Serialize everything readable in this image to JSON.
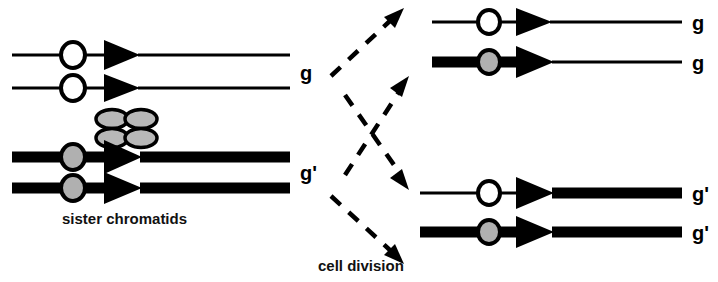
{
  "figure": {
    "background_color": "#ffffff",
    "ink_color": "#000000",
    "gray_fill_color": "#b0b0b0"
  },
  "captions": {
    "sister_chromatids": "sister chromatids",
    "cell_division": "cell division"
  },
  "left_cell": {
    "allele_label_top": "g",
    "allele_label_bottom": "g'",
    "chromatids": [
      {
        "id": "left-chromatid-1",
        "allele": "g",
        "left_arm_style": "thin",
        "right_arm_style": "thin",
        "centromere": "open"
      },
      {
        "id": "left-chromatid-2",
        "allele": "g",
        "left_arm_style": "thin",
        "right_arm_style": "thin",
        "centromere": "open"
      },
      {
        "id": "left-chromatid-3",
        "allele": "g'",
        "left_arm_style": "thick",
        "right_arm_style": "thick",
        "centromere": "gray"
      },
      {
        "id": "left-chromatid-4",
        "allele": "g'",
        "left_arm_style": "thick",
        "right_arm_style": "thick",
        "centromere": "gray"
      }
    ],
    "chiasma": {
      "label": "chiasma-cluster",
      "lobe_count": 4,
      "fill": "#b8b8b8"
    }
  },
  "right_cells": {
    "top_daughter": {
      "allele_label_1": "g",
      "allele_label_2": "g",
      "chromatids": [
        {
          "id": "right-top-chromatid-1",
          "allele": "g",
          "left_arm_style": "thin",
          "right_arm_style": "thin",
          "centromere": "open"
        },
        {
          "id": "right-top-chromatid-2",
          "allele": "g",
          "left_arm_style": "thick",
          "right_arm_style": "thin",
          "centromere": "gray"
        }
      ]
    },
    "bottom_daughter": {
      "allele_label_1": "g'",
      "allele_label_2": "g'",
      "chromatids": [
        {
          "id": "right-bottom-chromatid-1",
          "allele": "g'",
          "left_arm_style": "thin",
          "right_arm_style": "thick",
          "centromere": "open"
        },
        {
          "id": "right-bottom-chromatid-2",
          "allele": "g'",
          "left_arm_style": "thick",
          "right_arm_style": "thick",
          "centromere": "gray"
        }
      ]
    }
  },
  "division_arrows": {
    "count": 4,
    "style": "dashed",
    "directions": [
      "up-right",
      "up-right",
      "down-right",
      "down-right"
    ]
  }
}
